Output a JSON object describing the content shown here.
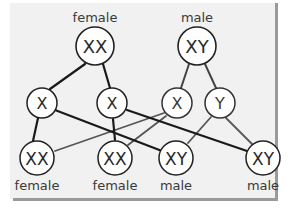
{
  "diagram": {
    "colors": {
      "panel_bg": "#f1f1f1",
      "border": "#9a9a9a",
      "node_fill": "#ffffff",
      "node_stroke": "#222222",
      "line_female": "#1a1a1a",
      "line_male": "#555555",
      "text": "#2a2a2a",
      "label_text": "#3a3a3a"
    },
    "parents": [
      {
        "id": "mother",
        "genotype": "XX",
        "label": "female"
      },
      {
        "id": "father",
        "genotype": "XY",
        "label": "male"
      }
    ],
    "gametes": [
      {
        "id": "egg1",
        "chromosome": "X",
        "from": "mother"
      },
      {
        "id": "egg2",
        "chromosome": "X",
        "from": "mother"
      },
      {
        "id": "sperm1",
        "chromosome": "X",
        "from": "father"
      },
      {
        "id": "sperm2",
        "chromosome": "Y",
        "from": "father"
      }
    ],
    "offspring": [
      {
        "id": "child1",
        "genotype": "XX",
        "label": "female"
      },
      {
        "id": "child2",
        "genotype": "XX",
        "label": "female"
      },
      {
        "id": "child3",
        "genotype": "XY",
        "label": "male"
      },
      {
        "id": "child4",
        "genotype": "XY",
        "label": "male"
      }
    ],
    "edges": [
      {
        "from": "mother",
        "to": "egg1"
      },
      {
        "from": "mother",
        "to": "egg2"
      },
      {
        "from": "father",
        "to": "sperm1"
      },
      {
        "from": "father",
        "to": "sperm2"
      },
      {
        "from": "egg1",
        "to": "child1"
      },
      {
        "from": "egg1",
        "to": "child3"
      },
      {
        "from": "egg2",
        "to": "child2"
      },
      {
        "from": "egg2",
        "to": "child4"
      },
      {
        "from": "sperm1",
        "to": "child1"
      },
      {
        "from": "sperm1",
        "to": "child2"
      },
      {
        "from": "sperm2",
        "to": "child3"
      },
      {
        "from": "sperm2",
        "to": "child4"
      }
    ]
  }
}
